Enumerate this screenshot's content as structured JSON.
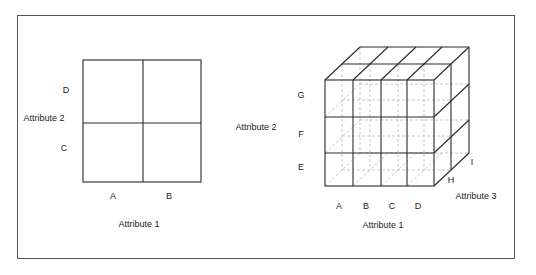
{
  "diagram": {
    "type": "data-cube-illustration",
    "left_grid": {
      "dimensions": 2,
      "x_axis_title": "Attribute 1",
      "x_values": [
        "A",
        "B"
      ],
      "y_axis_title": "Attribute 2",
      "y_values_bottom_to_top": [
        "C",
        "D"
      ]
    },
    "right_cube": {
      "dimensions": 3,
      "x_axis_title": "Attribute 1",
      "x_values": [
        "A",
        "B",
        "C",
        "D"
      ],
      "y_axis_title": "Attribute 2",
      "y_values_bottom_to_top": [
        "E",
        "F",
        "G"
      ],
      "z_axis_title": "Attribute 3",
      "z_values_front_to_back": [
        "H",
        "I"
      ]
    }
  },
  "labels": {
    "left": {
      "attr1": "Attribute 1",
      "attr2": "Attribute 2",
      "A": "A",
      "B": "B",
      "C": "C",
      "D": "D"
    },
    "right": {
      "attr1": "Attribute 1",
      "attr2": "Attribute 2",
      "attr3": "Attribute 3",
      "A": "A",
      "B": "B",
      "C": "C",
      "D": "D",
      "E": "E",
      "F": "F",
      "G": "G",
      "H": "H",
      "I": "I"
    }
  },
  "colors": {
    "line": "#2a2a2a",
    "hidden_line": "#bbbbbb",
    "frame": "#555555"
  }
}
